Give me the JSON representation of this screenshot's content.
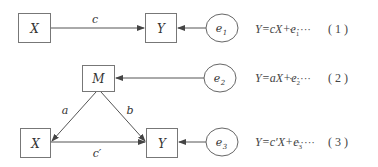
{
  "diagram1": {
    "nodes": {
      "x": {
        "label": "X"
      },
      "y": {
        "label": "Y"
      },
      "e1": {
        "label": "e",
        "sub": "1"
      }
    },
    "edges": {
      "c": {
        "label": "c"
      }
    },
    "equation": {
      "lhs": "Y=cX+e",
      "sub": "1",
      "dots": "······",
      "number": "( 1 )"
    }
  },
  "diagram2": {
    "nodes": {
      "m": {
        "label": "M"
      },
      "e2": {
        "label": "e",
        "sub": "2"
      },
      "x": {
        "label": "X"
      },
      "y": {
        "label": "Y"
      },
      "e3": {
        "label": "e",
        "sub": "3"
      }
    },
    "edges": {
      "a": {
        "label": "a"
      },
      "b": {
        "label": "b"
      },
      "c_prime": {
        "label": "c′"
      }
    },
    "equation2": {
      "lhs": "Y=aX+e",
      "sub": "2",
      "dots": "······",
      "number": "( 2 )"
    },
    "equation3": {
      "lhs": "Y=c′X+e",
      "sub": "3",
      "dots": "······",
      "number": "( 3 )"
    }
  },
  "colors": {
    "stroke": "#555555",
    "text": "#333333",
    "background": "#ffffff"
  }
}
